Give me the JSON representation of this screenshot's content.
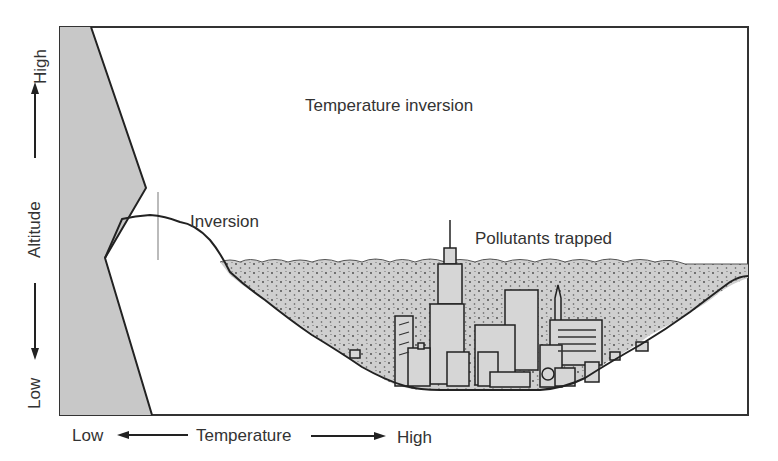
{
  "diagram": {
    "title": "Temperature inversion",
    "labels": {
      "inversion": "Inversion",
      "pollutants": "Pollutants trapped"
    },
    "y_axis": {
      "label": "Altitude",
      "high": "High",
      "low": "Low"
    },
    "x_axis": {
      "label": "Temperature",
      "low": "Low",
      "high": "High"
    },
    "colors": {
      "profile_fill": "#c8c8c8",
      "smog_fill": "#cfcfcf",
      "line": "#222222",
      "text": "#333333"
    }
  }
}
